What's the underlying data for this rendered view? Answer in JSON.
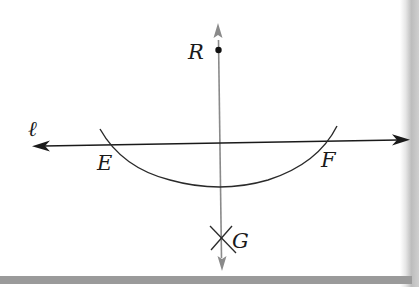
{
  "diagram": {
    "type": "geometric-construction",
    "line": {
      "label": "ℓ"
    },
    "points": {
      "R": {
        "label": "R"
      },
      "E": {
        "label": "E"
      },
      "F": {
        "label": "F"
      },
      "G": {
        "label": "G"
      }
    },
    "colors": {
      "line": "#1a1a1a",
      "perpendicular": "#8a8a8a",
      "arc": "#2a2a2a",
      "point": "#111111",
      "bottom_bar": "#9a9a9a"
    }
  }
}
